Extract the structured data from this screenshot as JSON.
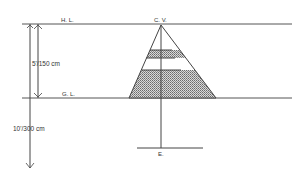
{
  "diagram": {
    "labels": {
      "horizon_line": "H. L.",
      "center_of_vision": "C. V.",
      "ground_line": "G. L.",
      "eye_point": "E.",
      "eye_height": "5'/150 cm",
      "viewing_distance": "10'/300 cm"
    },
    "colors": {
      "line": "#444444",
      "shade": "#9a9a9a"
    }
  }
}
